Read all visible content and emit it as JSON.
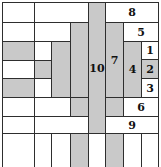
{
  "diagram": {
    "title": "",
    "colors": {
      "shaded": "#c9c9c9",
      "plain": "#ffffff",
      "line": "#2e2e2e"
    },
    "cells": [
      {
        "x": 2,
        "y": 2,
        "w": 33,
        "h": 21,
        "shade": false,
        "label": ""
      },
      {
        "x": 34,
        "y": 2,
        "w": 55,
        "h": 21,
        "shade": false,
        "label": ""
      },
      {
        "x": 88,
        "y": 2,
        "w": 18,
        "h": 132,
        "shade": true,
        "label": "10"
      },
      {
        "x": 105,
        "y": 2,
        "w": 54,
        "h": 21,
        "shade": false,
        "label": "8"
      },
      {
        "x": 2,
        "y": 22,
        "w": 33,
        "h": 20,
        "shade": false,
        "label": ""
      },
      {
        "x": 34,
        "y": 22,
        "w": 37,
        "h": 20,
        "shade": false,
        "label": ""
      },
      {
        "x": 70,
        "y": 22,
        "w": 19,
        "h": 76,
        "shade": true,
        "label": ""
      },
      {
        "x": 105,
        "y": 22,
        "w": 19,
        "h": 76,
        "shade": true,
        "label": "7"
      },
      {
        "x": 123,
        "y": 22,
        "w": 36,
        "h": 20,
        "shade": false,
        "label": "5"
      },
      {
        "x": 2,
        "y": 41,
        "w": 33,
        "h": 20,
        "shade": true,
        "label": ""
      },
      {
        "x": 34,
        "y": 41,
        "w": 18,
        "h": 20,
        "shade": false,
        "label": ""
      },
      {
        "x": 51,
        "y": 41,
        "w": 20,
        "h": 57,
        "shade": true,
        "label": ""
      },
      {
        "x": 123,
        "y": 41,
        "w": 19,
        "h": 57,
        "shade": true,
        "label": "4"
      },
      {
        "x": 141,
        "y": 41,
        "w": 18,
        "h": 19,
        "shade": false,
        "label": "1"
      },
      {
        "x": 2,
        "y": 60,
        "w": 33,
        "h": 19,
        "shade": false,
        "label": ""
      },
      {
        "x": 34,
        "y": 60,
        "w": 18,
        "h": 19,
        "shade": true,
        "label": ""
      },
      {
        "x": 141,
        "y": 59,
        "w": 18,
        "h": 20,
        "shade": true,
        "label": "2"
      },
      {
        "x": 2,
        "y": 78,
        "w": 33,
        "h": 20,
        "shade": true,
        "label": ""
      },
      {
        "x": 34,
        "y": 78,
        "w": 18,
        "h": 20,
        "shade": false,
        "label": ""
      },
      {
        "x": 141,
        "y": 78,
        "w": 18,
        "h": 20,
        "shade": false,
        "label": "3"
      },
      {
        "x": 2,
        "y": 97,
        "w": 33,
        "h": 20,
        "shade": false,
        "label": ""
      },
      {
        "x": 34,
        "y": 97,
        "w": 37,
        "h": 20,
        "shade": false,
        "label": ""
      },
      {
        "x": 70,
        "y": 97,
        "w": 19,
        "h": 20,
        "shade": true,
        "label": ""
      },
      {
        "x": 105,
        "y": 97,
        "w": 19,
        "h": 20,
        "shade": true,
        "label": ""
      },
      {
        "x": 123,
        "y": 97,
        "w": 36,
        "h": 20,
        "shade": false,
        "label": "6"
      },
      {
        "x": 2,
        "y": 116,
        "w": 33,
        "h": 18,
        "shade": false,
        "label": ""
      },
      {
        "x": 34,
        "y": 116,
        "w": 55,
        "h": 18,
        "shade": false,
        "label": ""
      },
      {
        "x": 105,
        "y": 116,
        "w": 54,
        "h": 18,
        "shade": false,
        "label": "9"
      },
      {
        "x": 2,
        "y": 133,
        "w": 33,
        "h": 34,
        "shade": false,
        "label": "",
        "open": true
      },
      {
        "x": 34,
        "y": 133,
        "w": 18,
        "h": 34,
        "shade": false,
        "label": "",
        "open": true
      },
      {
        "x": 51,
        "y": 133,
        "w": 20,
        "h": 34,
        "shade": false,
        "label": "",
        "open": true
      },
      {
        "x": 70,
        "y": 133,
        "w": 19,
        "h": 34,
        "shade": true,
        "label": "",
        "open": true
      },
      {
        "x": 88,
        "y": 133,
        "w": 18,
        "h": 34,
        "shade": false,
        "label": "",
        "open": true
      },
      {
        "x": 105,
        "y": 133,
        "w": 19,
        "h": 34,
        "shade": true,
        "label": "",
        "open": true
      },
      {
        "x": 123,
        "y": 133,
        "w": 19,
        "h": 34,
        "shade": false,
        "label": "",
        "open": true
      },
      {
        "x": 141,
        "y": 133,
        "w": 18,
        "h": 34,
        "shade": false,
        "label": "",
        "open": true
      }
    ]
  }
}
